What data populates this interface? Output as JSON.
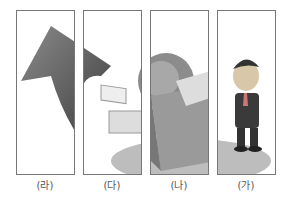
{
  "panels": [
    {
      "label": "(라)",
      "content": "arrow"
    },
    {
      "label": "(다)",
      "content": "arrow-and-globe"
    },
    {
      "label": "(나)",
      "content": "box-and-globe"
    },
    {
      "label": "(가)",
      "content": "businessman"
    }
  ],
  "colors": {
    "border": "#777777",
    "arrow": "#555555",
    "box": "#9a9a9a",
    "base": "#b5b5b5"
  }
}
